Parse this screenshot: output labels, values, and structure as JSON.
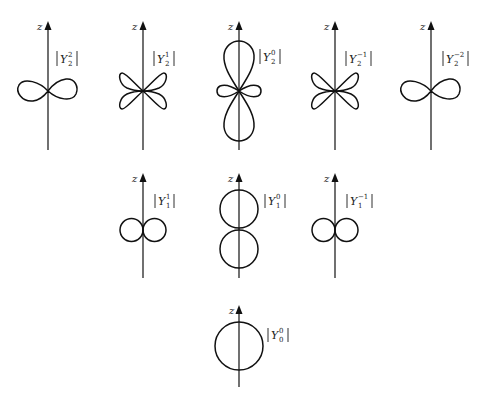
{
  "figure": {
    "axis_label": "z",
    "rows": [
      {
        "l": 2,
        "panels": [
          {
            "id": "Y2_2",
            "symbol": "Y",
            "l": "2",
            "m": "2",
            "label_text": "|Y_2^2|",
            "shape": "horizontal-figure-eight",
            "cx": 48
          },
          {
            "id": "Y2_1",
            "symbol": "Y",
            "l": "2",
            "m": "1",
            "label_text": "|Y_2^1|",
            "shape": "four-lobed-clover",
            "cx": 143
          },
          {
            "id": "Y2_0",
            "symbol": "Y",
            "l": "2",
            "m": "0",
            "label_text": "|Y_2^0|",
            "shape": "vertical-dumbbell-with-ring",
            "cx": 239
          },
          {
            "id": "Y2_-1",
            "symbol": "Y",
            "l": "2",
            "m": "-1",
            "label_text": "|Y_2^-1|",
            "shape": "four-lobed-clover",
            "cx": 335
          },
          {
            "id": "Y2_-2",
            "symbol": "Y",
            "l": "2",
            "m": "-2",
            "label_text": "|Y_2^-2|",
            "shape": "horizontal-figure-eight",
            "cx": 431
          }
        ]
      },
      {
        "l": 1,
        "panels": [
          {
            "id": "Y1_1",
            "symbol": "Y",
            "l": "1",
            "m": "1",
            "label_text": "|Y_1^1|",
            "shape": "two-horizontal-circles",
            "cx": 143
          },
          {
            "id": "Y1_0",
            "symbol": "Y",
            "l": "1",
            "m": "0",
            "label_text": "|Y_1^0|",
            "shape": "two-vertical-circles",
            "cx": 239
          },
          {
            "id": "Y1_-1",
            "symbol": "Y",
            "l": "1",
            "m": "-1",
            "label_text": "|Y_1^-1|",
            "shape": "two-horizontal-circles",
            "cx": 335
          }
        ]
      },
      {
        "l": 0,
        "panels": [
          {
            "id": "Y0_0",
            "symbol": "Y",
            "l": "0",
            "m": "0",
            "label_text": "|Y_0^0|",
            "shape": "circle",
            "cx": 239
          }
        ]
      }
    ]
  },
  "labels": {
    "z": "z",
    "Y": "Y",
    "r0": {
      "p0": {
        "m": "2",
        "l": "2"
      },
      "p1": {
        "m": "1",
        "l": "2"
      },
      "p2": {
        "m": "0",
        "l": "2"
      },
      "p3": {
        "m": "−1",
        "l": "2"
      },
      "p4": {
        "m": "−2",
        "l": "2"
      }
    },
    "r1": {
      "p0": {
        "m": "1",
        "l": "1"
      },
      "p1": {
        "m": "0",
        "l": "1"
      },
      "p2": {
        "m": "−1",
        "l": "1"
      }
    },
    "r2": {
      "p0": {
        "m": "0",
        "l": "0"
      }
    }
  },
  "colors": {
    "background": "#ffffff",
    "ink": "#111111"
  }
}
